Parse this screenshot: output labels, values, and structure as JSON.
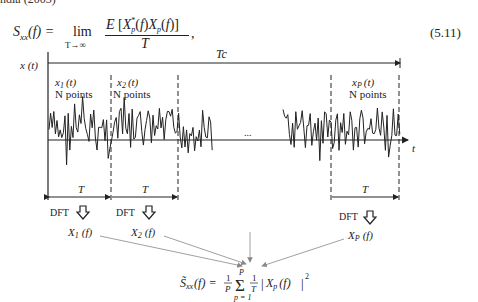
{
  "page": {
    "cropped_top_text": "ndia (2003)",
    "equation": {
      "lhs": "S",
      "lhs_sub": "xx",
      "lhs_arg": "(f) =",
      "lim": "lim",
      "lim_sub": "T→∞",
      "numerator": "E [X*p(f)Xp(f)]",
      "denominator": "T",
      "trailing": ",",
      "number": "(5.11)"
    }
  },
  "diagram": {
    "y_axis_label": "x (t)",
    "x_axis_label": "t",
    "total_duration_label": "Tc",
    "ellipsis": "...",
    "segments": [
      {
        "name_main": "x",
        "name_sub": "1",
        "name_arg": "(t)",
        "points_label": "N points",
        "duration_label": "T",
        "dft_label": "DFT",
        "spectrum_main": "X",
        "spectrum_sub": "1",
        "spectrum_arg": "(f)"
      },
      {
        "name_main": "x",
        "name_sub": "2",
        "name_arg": "(t)",
        "points_label": "N points",
        "duration_label": "T",
        "dft_label": "DFT",
        "spectrum_main": "X",
        "spectrum_sub": "2",
        "spectrum_arg": "(f)"
      },
      {
        "name_main": "x",
        "name_sub": "P",
        "name_arg": "(t)",
        "points_label": "N points",
        "duration_label": "T",
        "dft_label": "DFT",
        "spectrum_main": "X",
        "spectrum_sub": "P",
        "spectrum_arg": "(f)"
      }
    ],
    "result_formula": "S̃xx(f) = (1/P) Σ_{p=1}^{P} (1/T) |Xp(f)|²",
    "result": {
      "lhs": "S̃",
      "lhs_sub": "xx",
      "lhs_arg": "(f) =",
      "frac1_num": "1",
      "frac1_den": "P",
      "sigma": "Σ",
      "sum_top": "P",
      "sum_bottom": "p = 1",
      "frac2_num": "1",
      "frac2_den": "T",
      "abs_main": "X",
      "abs_sub": "p",
      "abs_arg": "(f)",
      "power": "2"
    }
  }
}
